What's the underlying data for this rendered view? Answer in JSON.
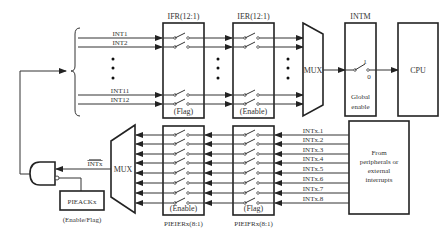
{
  "diagram": {
    "type": "block-diagram",
    "top_path": {
      "inputs": [
        "INT1",
        "INT2",
        "INT11",
        "INT12"
      ],
      "ifr": {
        "title": "IFR(12:1)",
        "caption": "(Flag)"
      },
      "ier": {
        "title": "IER(12:1)",
        "caption": "(Enable)"
      },
      "mux": {
        "label": "MUX"
      },
      "intm": {
        "title": "INTM",
        "switch_on": "1",
        "switch_off": "0",
        "caption_line1": "Global",
        "caption_line2": "enable"
      },
      "cpu": {
        "label": "CPU"
      }
    },
    "bottom_path": {
      "source": {
        "line1": "From",
        "line2": "peripherals or",
        "line3": "external",
        "line4": "interrupts"
      },
      "inputs": [
        "INTx.1",
        "INTx.2",
        "INTx.3",
        "INTx.4",
        "INTx.5",
        "INTx.6",
        "INTx.7",
        "INTx.8"
      ],
      "pieifr": {
        "title": "PIEIFRx(8:1)",
        "caption": "(Flag)"
      },
      "pieier": {
        "title": "PIEIERx(8:1)",
        "caption": "(Enable)"
      },
      "mux": {
        "label": "MUX"
      },
      "intx_out": "INTx",
      "pieack": {
        "label": "PIEACKx",
        "caption": "(Enable/Flag)"
      }
    }
  }
}
